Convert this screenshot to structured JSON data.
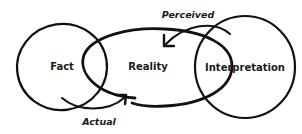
{
  "diagram": {
    "nodes": [
      {
        "id": "fact",
        "label": "Fact"
      },
      {
        "id": "reality",
        "label": "Reality"
      },
      {
        "id": "interpretation",
        "label": "Interpretation"
      }
    ],
    "edges": [
      {
        "from": "fact",
        "to": "reality",
        "label": "Actual"
      },
      {
        "from": "interpretation",
        "to": "reality",
        "label": "Perceived"
      }
    ],
    "colors": {
      "stroke": "#111111",
      "background": "#ffffff",
      "text": "#1a1a1a"
    }
  }
}
